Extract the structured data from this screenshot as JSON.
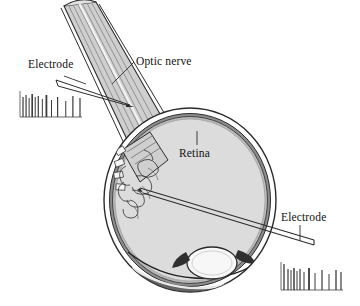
{
  "figure": {
    "kind": "anatomical-diagram",
    "background_color": "#ffffff",
    "ink_color": "#111111"
  },
  "labels": {
    "electrode_left": "Electrode",
    "optic_nerve": "Optic nerve",
    "retina": "Retina",
    "electrode_right": "Electrode"
  },
  "palette": {
    "outline": "#2b2b2b",
    "sclera_fill": "#ffffff",
    "choroid_fill": "#8d8d8d",
    "retina_fill": "#b9b9b9",
    "vitreous_fill": "#dcdcdc",
    "nerve_fill": "#cfcfcf",
    "nerve_stripe": "#8a8a8a",
    "lens_fill": "#f7f7f7",
    "ciliary_dark": "#4a4a4a",
    "spike_color": "#3a3a3a",
    "axis_color": "#6a6a6a"
  },
  "anatomy": {
    "globe": {
      "cx": 190,
      "cy": 200,
      "rx": 86,
      "ry": 92
    },
    "lens": {
      "cx": 212,
      "cy": 263,
      "rx": 25,
      "ry": 16
    },
    "optic_disc": {
      "x": 131,
      "y": 180
    },
    "nerve_stripe_count": 7
  },
  "chart_data": [
    {
      "type": "raster",
      "name": "spike-train-left",
      "title": "",
      "axis_origin": [
        20,
        117
      ],
      "axis_width": 62,
      "axis_height": 26,
      "spike_times": [
        1,
        4,
        7,
        10,
        13,
        16,
        20,
        24,
        29,
        35,
        43,
        50,
        57
      ],
      "spike_heights": [
        20,
        22,
        19,
        23,
        20,
        21,
        18,
        22,
        17,
        20,
        16,
        21,
        19
      ],
      "spike_weights": [
        1.2,
        1.2,
        1.0,
        1.6,
        1.0,
        1.2,
        1.0,
        1.8,
        1.0,
        1.2,
        1.0,
        1.2,
        1.2
      ],
      "xlabel": "",
      "ylabel": ""
    },
    {
      "type": "raster",
      "name": "spike-train-right",
      "title": "",
      "axis_origin": [
        281,
        290
      ],
      "axis_width": 62,
      "axis_height": 28,
      "spike_times": [
        1,
        5,
        8,
        11,
        14,
        17,
        21,
        26,
        32,
        39,
        46,
        53,
        58
      ],
      "spike_heights": [
        26,
        21,
        20,
        22,
        19,
        21,
        18,
        22,
        17,
        20,
        16,
        20,
        18
      ],
      "spike_weights": [
        1.3,
        1.2,
        1.0,
        1.5,
        1.0,
        1.2,
        1.0,
        1.8,
        1.0,
        1.2,
        1.0,
        1.3,
        1.2
      ],
      "xlabel": "",
      "ylabel": ""
    }
  ]
}
